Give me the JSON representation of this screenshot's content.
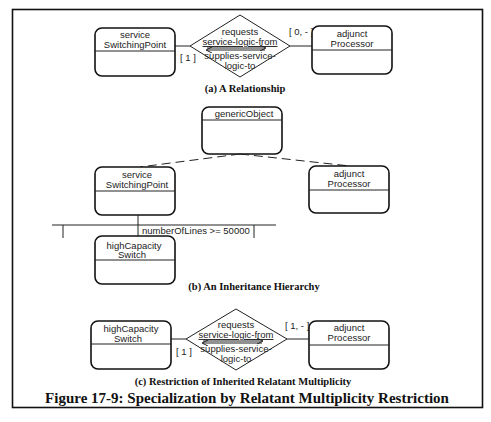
{
  "figure": {
    "title": "Figure 17-9: Specialization by Relatant Multiplicity Restriction"
  },
  "panel_a": {
    "caption": "(a) A Relationship",
    "left_class": {
      "line1": "service",
      "line2": "SwitchingPoint"
    },
    "right_class": {
      "line1": "adjunct",
      "line2": "Processor"
    },
    "relationship": {
      "line1": "requests",
      "line2": "service-logic-from",
      "line3": "supplies-service-",
      "line4": "logic-to"
    },
    "left_multiplicity": "[ 1 ]",
    "right_multiplicity": "[ 0, - ]"
  },
  "panel_b": {
    "caption": "(b) An Inheritance Hierarchy",
    "root_class": {
      "line1": "genericObject"
    },
    "left_class": {
      "line1": "service",
      "line2": "SwitchingPoint"
    },
    "right_class": {
      "line1": "adjunct",
      "line2": "Processor"
    },
    "subclass": {
      "line1": "highCapacity",
      "line2": "Switch"
    },
    "discriminator": "numberOfLines >= 50000"
  },
  "panel_c": {
    "caption": "(c) Restriction of Inherited Relatant Multiplicity",
    "left_class": {
      "line1": "highCapacity",
      "line2": "Switch"
    },
    "right_class": {
      "line1": "adjunct",
      "line2": "Processor"
    },
    "relationship": {
      "line1": "requests",
      "line2": "service-logic-from",
      "line3": "supplies-service-",
      "line4": "logic-to"
    },
    "left_multiplicity": "[ 1 ]",
    "right_multiplicity": "[ 1, - ]"
  }
}
